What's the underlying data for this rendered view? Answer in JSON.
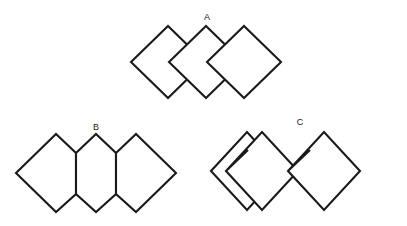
{
  "page": {
    "background_color": "#ffffff",
    "stroke_color": "#1a1a1a",
    "fill_color": "#ffffff",
    "width": 407,
    "height": 226
  },
  "figures": [
    {
      "id": "A",
      "label": "A",
      "label_x": 207,
      "label_y": 20,
      "description": "Three overlapping squares rotated 45 degrees (diamonds) in a horizontal row",
      "shape_count": 3,
      "arrangement": "overlapping",
      "shapes": [
        {
          "name": "diamond-a1",
          "type": "diamond",
          "points": "131,62 168,26 205,62 168,98"
        },
        {
          "name": "diamond-a2",
          "type": "diamond",
          "points": "169,62 206,26 243,62 206,98"
        },
        {
          "name": "diamond-a3",
          "type": "diamond",
          "points": "207,62 244,26 281,62 244,98"
        }
      ]
    },
    {
      "id": "B",
      "label": "B",
      "label_x": 96,
      "label_y": 130,
      "description": "Three edge-sharing hexagonal shapes forming a continuous band",
      "shape_count": 3,
      "arrangement": "edge-sharing",
      "shapes": [
        {
          "name": "hexagon-b1",
          "type": "hexagon",
          "points": "16,173 56,134 76,153 76,194 56,212 16,173"
        },
        {
          "name": "hexagon-b2",
          "type": "hexagon",
          "points": "76,153 96,134 116,153 116,194 96,212 76,194"
        },
        {
          "name": "hexagon-b3",
          "type": "hexagon",
          "points": "116,153 136,134 176,173 136,212 116,194 116,153"
        }
      ]
    },
    {
      "id": "C",
      "label": "C",
      "label_x": 300,
      "label_y": 125,
      "description": "One full diamond followed by two chevron shapes (diamonds with a V notch on the left vertex)",
      "shape_count": 3,
      "arrangement": "separate",
      "shapes": [
        {
          "name": "diamond-c1",
          "type": "diamond",
          "points": "211,171 247,132 283,171 247,210"
        },
        {
          "name": "chevron-c2",
          "type": "chevron",
          "points": "226,171 262,132 298,171 262,210 226,171 248,150"
        },
        {
          "name": "chevron-c3",
          "type": "chevron",
          "points": "288,171 324,132 360,171 324,210 288,171 310,150"
        }
      ]
    }
  ]
}
